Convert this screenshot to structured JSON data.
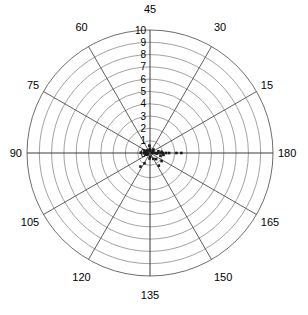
{
  "chart_data": {
    "type": "scatter",
    "coordinate_system": "polar",
    "title": "",
    "xlabel": "",
    "ylabel": "",
    "grid": true,
    "legend": null,
    "radial_axis": {
      "label": "",
      "min": 0,
      "max": 10,
      "tick_step": 1,
      "ticks": [
        0,
        1,
        2,
        3,
        4,
        5,
        6,
        7,
        8,
        9,
        10
      ],
      "tick_labels": [
        "0",
        "1",
        "2",
        "3",
        "4",
        "5",
        "6",
        "7",
        "8",
        "9",
        "10"
      ],
      "tick_label_position": "vertical-up-from-center"
    },
    "angular_axis": {
      "label": "",
      "unit": "degrees",
      "tick_step": 15,
      "direction": "clockwise",
      "zero_at": "upper-left-of-top",
      "ticks": [
        45,
        30,
        15,
        180,
        165,
        150,
        135,
        120,
        105,
        90,
        75,
        60
      ],
      "tick_labels": [
        "45",
        "30",
        "15",
        "180",
        "165",
        "150",
        "135",
        "120",
        "105",
        "90",
        "75",
        "60"
      ]
    },
    "angular_tick_placement": [
      {
        "label": "45",
        "screen_angle_deg": 90
      },
      {
        "label": "30",
        "screen_angle_deg": 60
      },
      {
        "label": "15",
        "screen_angle_deg": 30
      },
      {
        "label": "180",
        "screen_angle_deg": 0
      },
      {
        "label": "165",
        "screen_angle_deg": -30
      },
      {
        "label": "150",
        "screen_angle_deg": -60
      },
      {
        "label": "135",
        "screen_angle_deg": -90
      },
      {
        "label": "120",
        "screen_angle_deg": -120
      },
      {
        "label": "105",
        "screen_angle_deg": -150
      },
      {
        "label": "90",
        "screen_angle_deg": 180
      },
      {
        "label": "75",
        "screen_angle_deg": 150
      },
      {
        "label": "60",
        "screen_angle_deg": 120
      }
    ],
    "series": [
      {
        "name": "data",
        "marker": "square",
        "marker_size_px": 2.6,
        "color": "#1a1a1a",
        "points": [
          {
            "theta_screen_deg": 0,
            "r": 0.15
          },
          {
            "theta_screen_deg": 0,
            "r": 0.4
          },
          {
            "theta_screen_deg": 0,
            "r": 0.62
          },
          {
            "theta_screen_deg": 0,
            "r": 0.85
          },
          {
            "theta_screen_deg": 0,
            "r": 1.05
          },
          {
            "theta_screen_deg": 0,
            "r": 1.3
          },
          {
            "theta_screen_deg": 0,
            "r": 1.55
          },
          {
            "theta_screen_deg": 0,
            "r": 2.15
          },
          {
            "theta_screen_deg": 0,
            "r": 2.55
          },
          {
            "theta_screen_deg": 4,
            "r": 0.3
          },
          {
            "theta_screen_deg": 6,
            "r": 0.95
          },
          {
            "theta_screen_deg": -5,
            "r": 0.55
          },
          {
            "theta_screen_deg": -8,
            "r": 1.1
          },
          {
            "theta_screen_deg": 175,
            "r": 0.35
          },
          {
            "theta_screen_deg": 178,
            "r": 0.75
          },
          {
            "theta_screen_deg": 182,
            "r": 0.5
          },
          {
            "theta_screen_deg": 186,
            "r": 0.28
          },
          {
            "theta_screen_deg": 168,
            "r": 0.22
          },
          {
            "theta_screen_deg": 195,
            "r": 0.2
          },
          {
            "theta_screen_deg": 90,
            "r": 0.35
          },
          {
            "theta_screen_deg": 95,
            "r": 0.6
          },
          {
            "theta_screen_deg": 100,
            "r": 0.25
          },
          {
            "theta_screen_deg": 85,
            "r": 0.18
          },
          {
            "theta_screen_deg": -85,
            "r": 0.3
          },
          {
            "theta_screen_deg": -95,
            "r": 0.45
          },
          {
            "theta_screen_deg": -60,
            "r": 0.55
          },
          {
            "theta_screen_deg": -45,
            "r": 0.7
          },
          {
            "theta_screen_deg": -35,
            "r": 1.15
          },
          {
            "theta_screen_deg": -55,
            "r": 1.25
          },
          {
            "theta_screen_deg": -118,
            "r": 0.95
          },
          {
            "theta_screen_deg": -125,
            "r": 1.35
          },
          {
            "theta_screen_deg": 45,
            "r": 0.4
          },
          {
            "theta_screen_deg": 30,
            "r": 0.28
          },
          {
            "theta_screen_deg": 140,
            "r": 0.32
          },
          {
            "theta_screen_deg": 160,
            "r": 0.48
          },
          {
            "theta_screen_deg": 12,
            "r": 0.7
          },
          {
            "theta_screen_deg": -15,
            "r": 0.88
          },
          {
            "theta_screen_deg": 200,
            "r": 0.38
          },
          {
            "theta_screen_deg": 210,
            "r": 0.26
          },
          {
            "theta_screen_deg": -160,
            "r": 0.3
          }
        ]
      }
    ],
    "geometry": {
      "center_x": 150,
      "center_y": 153,
      "outer_radius_px": 123
    },
    "colors": {
      "background": "#ffffff",
      "grid_ring": "#8a8a8a",
      "grid_outer_ring": "#6e6e6e",
      "spoke": "#4d4d4d",
      "marker": "#1a1a1a",
      "text": "#000000"
    }
  }
}
